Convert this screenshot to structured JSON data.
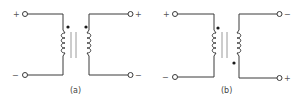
{
  "figure": {
    "panels": [
      {
        "id": "a",
        "caption": "(a)",
        "primary": {
          "top_sign": "+",
          "bottom_sign": "−"
        },
        "secondary": {
          "top_sign": "+",
          "bottom_sign": "−"
        },
        "dots": "both-top"
      },
      {
        "id": "b",
        "caption": "(b)",
        "primary": {
          "top_sign": "+",
          "bottom_sign": "−"
        },
        "secondary": {
          "top_sign": "−",
          "bottom_sign": "+"
        },
        "dots": "primary-top-secondary-bottom"
      }
    ],
    "colors": {
      "wire": "#3a3a3a",
      "core": "#9a9a9a",
      "dot": "#1a1a1a"
    }
  }
}
